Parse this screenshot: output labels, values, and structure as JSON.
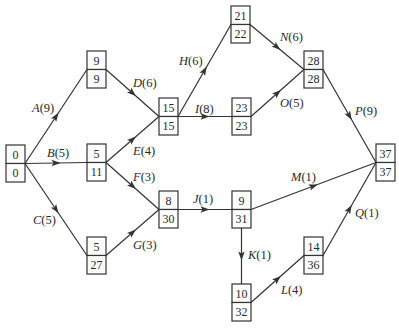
{
  "diagram": {
    "type": "activity-on-arrow project network",
    "nodes": [
      {
        "id": "n1",
        "x": 6,
        "y": 145,
        "earliest": "0",
        "latest": "0"
      },
      {
        "id": "n2",
        "x": 87,
        "y": 51,
        "earliest": "9",
        "latest": "9"
      },
      {
        "id": "n3",
        "x": 87,
        "y": 144,
        "earliest": "5",
        "latest": "11"
      },
      {
        "id": "n4",
        "x": 87,
        "y": 237,
        "earliest": "5",
        "latest": "27"
      },
      {
        "id": "n5",
        "x": 159,
        "y": 98,
        "earliest": "15",
        "latest": "15"
      },
      {
        "id": "n6",
        "x": 159,
        "y": 191,
        "earliest": "8",
        "latest": "30"
      },
      {
        "id": "n7",
        "x": 231,
        "y": 6,
        "earliest": "21",
        "latest": "22"
      },
      {
        "id": "n8",
        "x": 232,
        "y": 98,
        "earliest": "23",
        "latest": "23"
      },
      {
        "id": "n9",
        "x": 232,
        "y": 191,
        "earliest": "9",
        "latest": "31"
      },
      {
        "id": "n10",
        "x": 232,
        "y": 284,
        "earliest": "10",
        "latest": "32"
      },
      {
        "id": "n11",
        "x": 304,
        "y": 51,
        "earliest": "28",
        "latest": "28"
      },
      {
        "id": "n12",
        "x": 304,
        "y": 237,
        "earliest": "14",
        "latest": "36"
      },
      {
        "id": "n13",
        "x": 376,
        "y": 144,
        "earliest": "37",
        "latest": "37"
      }
    ],
    "edges": [
      {
        "activity": "A",
        "duration": "(9)",
        "from": "n1",
        "to": "n2",
        "label_x": 32,
        "label_y": 112
      },
      {
        "activity": "B",
        "duration": "(5)",
        "from": "n1",
        "to": "n3",
        "label_x": 47,
        "label_y": 157
      },
      {
        "activity": "C",
        "duration": "(5)",
        "from": "n1",
        "to": "n4",
        "label_x": 33,
        "label_y": 224
      },
      {
        "activity": "D",
        "duration": "(6)",
        "from": "n2",
        "to": "n5",
        "label_x": 133,
        "label_y": 87
      },
      {
        "activity": "E",
        "duration": "(4)",
        "from": "n3",
        "to": "n5",
        "label_x": 133,
        "label_y": 155
      },
      {
        "activity": "F",
        "duration": "(3)",
        "from": "n3",
        "to": "n6",
        "label_x": 133,
        "label_y": 181
      },
      {
        "activity": "G",
        "duration": "(3)",
        "from": "n4",
        "to": "n6",
        "label_x": 133,
        "label_y": 249
      },
      {
        "activity": "H",
        "duration": "(6)",
        "from": "n5",
        "to": "n7",
        "label_x": 179,
        "label_y": 65
      },
      {
        "activity": "I",
        "duration": "(8)",
        "from": "n5",
        "to": "n8",
        "label_x": 195,
        "label_y": 113
      },
      {
        "activity": "J",
        "duration": "(1)",
        "from": "n6",
        "to": "n9",
        "label_x": 193,
        "label_y": 203
      },
      {
        "activity": "K",
        "duration": "(1)",
        "from": "n9",
        "to": "n10",
        "label_x": 248,
        "label_y": 259
      },
      {
        "activity": "L",
        "duration": "(4)",
        "from": "n10",
        "to": "n12",
        "label_x": 281,
        "label_y": 294
      },
      {
        "activity": "M",
        "duration": "(1)",
        "from": "n9",
        "to": "n13",
        "label_x": 291,
        "label_y": 181
      },
      {
        "activity": "N",
        "duration": "(6)",
        "from": "n7",
        "to": "n11",
        "label_x": 280,
        "label_y": 41
      },
      {
        "activity": "O",
        "duration": "(5)",
        "from": "n8",
        "to": "n11",
        "label_x": 280,
        "label_y": 107
      },
      {
        "activity": "P",
        "duration": "(9)",
        "from": "n11",
        "to": "n13",
        "label_x": 355,
        "label_y": 115
      },
      {
        "activity": "Q",
        "duration": "(1)",
        "from": "n12",
        "to": "n13",
        "label_x": 355,
        "label_y": 217
      }
    ]
  }
}
